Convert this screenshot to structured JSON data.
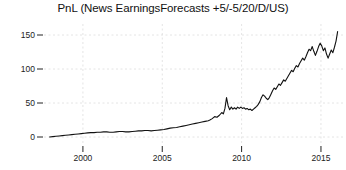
{
  "chart_data": {
    "type": "line",
    "title": "PnL (News EarningsForecasts +5/-5/20/D/US)",
    "xlabel": "",
    "ylabel": "",
    "xlim": [
      1997.8,
      2016.2
    ],
    "ylim": [
      -8,
      168
    ],
    "grid": true,
    "legend": false,
    "line_color": "#111111",
    "grid_color": "#dddddd",
    "background_color": "#ffffff",
    "xticks": [
      2000,
      2005,
      2010,
      2015
    ],
    "xtick_labels": [
      "2000",
      "2005",
      "2010",
      "2015"
    ],
    "yticks": [
      0,
      50,
      100,
      150
    ],
    "ytick_labels": [
      "0",
      "50",
      "100",
      "150"
    ],
    "series": [
      {
        "name": "PnL",
        "x": [
          1997.9,
          1998.1,
          1998.3,
          1998.5,
          1998.7,
          1998.9,
          1999.1,
          1999.3,
          1999.5,
          1999.7,
          1999.9,
          2000.1,
          2000.3,
          2000.5,
          2000.7,
          2000.9,
          2001.1,
          2001.3,
          2001.5,
          2001.7,
          2001.9,
          2002.1,
          2002.3,
          2002.5,
          2002.7,
          2002.9,
          2003.1,
          2003.3,
          2003.5,
          2003.7,
          2003.9,
          2004.1,
          2004.3,
          2004.5,
          2004.7,
          2004.9,
          2005.1,
          2005.3,
          2005.5,
          2005.7,
          2005.9,
          2006.1,
          2006.3,
          2006.5,
          2006.7,
          2006.9,
          2007.1,
          2007.3,
          2007.5,
          2007.7,
          2007.9,
          2008.0,
          2008.15,
          2008.3,
          2008.45,
          2008.6,
          2008.75,
          2008.85,
          2008.95,
          2009.05,
          2009.15,
          2009.25,
          2009.35,
          2009.45,
          2009.55,
          2009.65,
          2009.75,
          2009.85,
          2009.95,
          2010.05,
          2010.15,
          2010.25,
          2010.35,
          2010.45,
          2010.55,
          2010.65,
          2010.75,
          2010.85,
          2010.95,
          2011.05,
          2011.15,
          2011.25,
          2011.35,
          2011.45,
          2011.55,
          2011.65,
          2011.75,
          2011.85,
          2011.95,
          2012.05,
          2012.15,
          2012.25,
          2012.35,
          2012.45,
          2012.55,
          2012.65,
          2012.75,
          2012.85,
          2012.95,
          2013.05,
          2013.15,
          2013.25,
          2013.35,
          2013.45,
          2013.55,
          2013.65,
          2013.75,
          2013.85,
          2013.95,
          2014.05,
          2014.15,
          2014.25,
          2014.35,
          2014.45,
          2014.55,
          2014.65,
          2014.75,
          2014.85,
          2014.95,
          2015.05,
          2015.15,
          2015.25,
          2015.35,
          2015.45,
          2015.55,
          2015.65,
          2015.75,
          2015.85,
          2015.95,
          2016.05
        ],
        "y": [
          0,
          0.5,
          1,
          1.5,
          2,
          2.5,
          3,
          3.5,
          4,
          4.5,
          5,
          5.5,
          6,
          6.5,
          6.5,
          7,
          7,
          7.5,
          7.5,
          7,
          7,
          7.5,
          8,
          8,
          7.5,
          7.5,
          8,
          8.5,
          9,
          9,
          9.5,
          9.5,
          9,
          9.5,
          10,
          10.5,
          11,
          12,
          13,
          13.5,
          14,
          15,
          16,
          17,
          18,
          19,
          20,
          21,
          22,
          23,
          24,
          25,
          27,
          30,
          29,
          32,
          36,
          34,
          42,
          58,
          46,
          40,
          44,
          41,
          43,
          41,
          44,
          42,
          44,
          42,
          43,
          41,
          42,
          40,
          41,
          39,
          41,
          43,
          45,
          48,
          52,
          58,
          62,
          60,
          57,
          55,
          58,
          63,
          68,
          72,
          70,
          74,
          78,
          76,
          80,
          84,
          82,
          86,
          90,
          94,
          98,
          96,
          101,
          105,
          103,
          108,
          112,
          116,
          113,
          118,
          124,
          129,
          127,
          133,
          126,
          120,
          126,
          133,
          138,
          134,
          127,
          131,
          122,
          116,
          122,
          128,
          124,
          132,
          141,
          155
        ]
      }
    ]
  },
  "axes": {
    "ytick_positions_px": [
      137,
      103,
      69,
      35
    ],
    "xtick_positions_px": [
      90,
      167,
      244,
      320
    ]
  }
}
